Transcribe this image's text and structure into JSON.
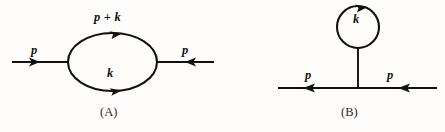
{
  "figure": {
    "background_color": "#fefdfb",
    "ink_color": "#111111",
    "width": 445,
    "height": 132,
    "type": "feynman-diagram-pair",
    "panels": [
      {
        "id": "A",
        "panel_label": "(A)",
        "description": "self-energy bubble loop on a propagator line",
        "labels": {
          "loop_top": "p + k",
          "loop_bottom": "k",
          "external_left": "p",
          "external_right": "p"
        },
        "arrows": {
          "external_left_direction": "right",
          "external_right_direction": "left",
          "loop_top_direction": "right",
          "loop_bottom_direction": "right"
        }
      },
      {
        "id": "B",
        "panel_label": "(B)",
        "description": "tadpole loop attached by a stem to a propagator line",
        "labels": {
          "loop": "k",
          "external_left": "p",
          "external_right": "p"
        },
        "arrows": {
          "external_left_direction": "left",
          "external_right_direction": "left",
          "loop_top_direction": "right"
        }
      }
    ]
  }
}
